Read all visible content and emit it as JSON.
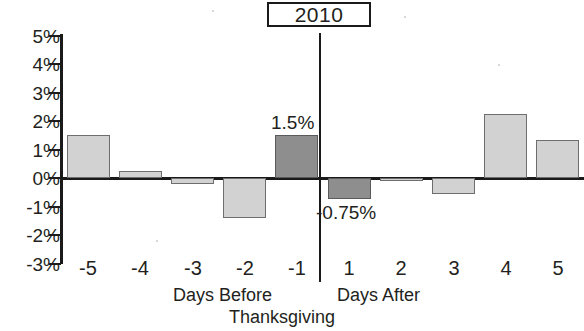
{
  "chart_data": {
    "type": "bar",
    "title": "2010",
    "xlabel": "Days Before Thanksgiving / Days After Thanksgiving",
    "ylabel": "",
    "categories": [
      "-5",
      "-4",
      "-3",
      "-2",
      "-1",
      "1",
      "2",
      "3",
      "4",
      "5"
    ],
    "values": [
      1.5,
      0.25,
      -0.2,
      -1.4,
      1.5,
      -0.75,
      -0.1,
      -0.55,
      2.25,
      1.35
    ],
    "value_unit": "%",
    "ylim": [
      -3,
      5
    ],
    "ytick_labels": [
      "5%",
      "4%",
      "3%",
      "2%",
      "1%",
      "0%",
      "-1%",
      "-2%",
      "-3%"
    ],
    "ytick_values": [
      5,
      4,
      3,
      2,
      1,
      0,
      -1,
      -2,
      -3
    ],
    "grid": false,
    "legend": "none",
    "annotations": [
      {
        "category": "-1",
        "text": "1.5%"
      },
      {
        "category": "1",
        "text": "-0.75%"
      }
    ],
    "highlighted_categories": [
      "-1",
      "1"
    ],
    "series_colors": {
      "normal": "#d2d2d2",
      "highlight": "#8e8e8e",
      "axis": "#1a1a1a"
    },
    "group_labels": {
      "before": "Days Before",
      "after": "Days After",
      "shared": "Thanksgiving"
    }
  },
  "bars": [
    {
      "label": "-5",
      "value": "1.5",
      "style": "light"
    },
    {
      "label": "-4",
      "value": "0.25",
      "style": "light"
    },
    {
      "label": "-3",
      "value": "-0.2",
      "style": "light"
    },
    {
      "label": "-2",
      "value": "-1.4",
      "style": "light"
    },
    {
      "label": "-1",
      "value": "1.5",
      "style": "dark"
    },
    {
      "label": "1",
      "value": "-0.75",
      "style": "dark"
    },
    {
      "label": "2",
      "value": "-0.1",
      "style": "light"
    },
    {
      "label": "3",
      "value": "-0.55",
      "style": "light"
    },
    {
      "label": "4",
      "value": "2.25",
      "style": "light"
    },
    {
      "label": "5",
      "value": "1.35",
      "style": "light"
    }
  ],
  "callouts": {
    "positive": "1.5%",
    "negative": "-0.75%"
  }
}
